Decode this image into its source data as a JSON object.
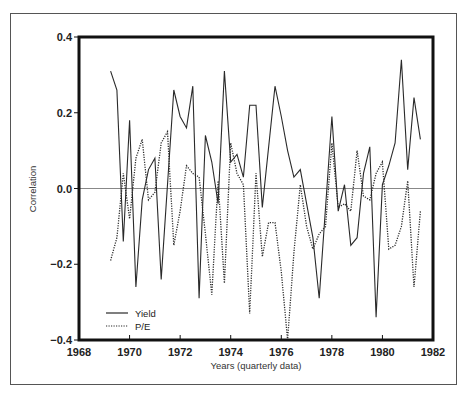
{
  "chart_data": {
    "type": "line",
    "title": "",
    "xlabel": "Years (quarterly data)",
    "ylabel": "Correlation",
    "xlim": [
      1968,
      1982
    ],
    "ylim": [
      -0.4,
      0.4
    ],
    "x_ticks": [
      1968,
      1970,
      1972,
      1974,
      1976,
      1978,
      1980,
      1982
    ],
    "x_tick_labels": [
      "1968",
      "1970",
      "1972",
      "1974",
      "1976",
      "1978",
      "1980",
      "1982"
    ],
    "y_ticks": [
      0.4,
      0.2,
      0.0,
      -0.2,
      -0.4
    ],
    "y_tick_labels": [
      "0.4",
      "0.2",
      "0.0",
      "−0.2",
      "−0.4"
    ],
    "grid": false,
    "reference_line": 0.0,
    "legend": {
      "position": "lower-left",
      "entries": [
        "Yield",
        "P/E"
      ]
    },
    "series": [
      {
        "name": "Yield",
        "style": "solid",
        "points": [
          [
            1969.25,
            0.31
          ],
          [
            1969.5,
            0.26
          ],
          [
            1969.75,
            -0.14
          ],
          [
            1970.0,
            0.18
          ],
          [
            1970.25,
            -0.26
          ],
          [
            1970.5,
            -0.03
          ],
          [
            1970.75,
            0.05
          ],
          [
            1971.0,
            0.08
          ],
          [
            1971.25,
            -0.24
          ],
          [
            1971.75,
            0.26
          ],
          [
            1972.0,
            0.19
          ],
          [
            1972.25,
            0.16
          ],
          [
            1972.5,
            0.27
          ],
          [
            1972.75,
            -0.29
          ],
          [
            1973.0,
            0.14
          ],
          [
            1973.25,
            0.07
          ],
          [
            1973.5,
            -0.04
          ],
          [
            1973.75,
            0.31
          ],
          [
            1974.0,
            0.07
          ],
          [
            1974.25,
            0.09
          ],
          [
            1974.5,
            0.03
          ],
          [
            1974.75,
            0.22
          ],
          [
            1975.0,
            0.22
          ],
          [
            1975.25,
            -0.05
          ],
          [
            1975.75,
            0.27
          ],
          [
            1976.0,
            0.19
          ],
          [
            1976.25,
            0.1
          ],
          [
            1976.5,
            0.03
          ],
          [
            1976.75,
            0.05
          ],
          [
            1977.0,
            -0.04
          ],
          [
            1977.25,
            -0.13
          ],
          [
            1977.5,
            -0.29
          ],
          [
            1978.0,
            0.19
          ],
          [
            1978.25,
            -0.06
          ],
          [
            1978.5,
            0.01
          ],
          [
            1978.75,
            -0.15
          ],
          [
            1979.0,
            -0.13
          ],
          [
            1979.25,
            0.04
          ],
          [
            1979.5,
            0.11
          ],
          [
            1979.75,
            -0.34
          ],
          [
            1980.0,
            0.01
          ],
          [
            1980.25,
            0.06
          ],
          [
            1980.5,
            0.12
          ],
          [
            1980.75,
            0.34
          ],
          [
            1981.0,
            0.05
          ],
          [
            1981.25,
            0.24
          ],
          [
            1981.5,
            0.13
          ]
        ]
      },
      {
        "name": "P/E",
        "style": "dotted",
        "points": [
          [
            1969.25,
            -0.19
          ],
          [
            1969.5,
            -0.13
          ],
          [
            1969.75,
            0.04
          ],
          [
            1970.0,
            -0.08
          ],
          [
            1970.25,
            0.08
          ],
          [
            1970.5,
            0.13
          ],
          [
            1970.75,
            -0.03
          ],
          [
            1971.0,
            -0.01
          ],
          [
            1971.25,
            0.12
          ],
          [
            1971.5,
            0.15
          ],
          [
            1971.75,
            -0.15
          ],
          [
            1972.0,
            -0.06
          ],
          [
            1972.25,
            0.06
          ],
          [
            1972.5,
            0.04
          ],
          [
            1972.75,
            0.03
          ],
          [
            1973.0,
            -0.12
          ],
          [
            1973.25,
            -0.28
          ],
          [
            1973.5,
            0.02
          ],
          [
            1973.75,
            -0.25
          ],
          [
            1974.0,
            0.12
          ],
          [
            1974.25,
            0.04
          ],
          [
            1974.5,
            0.01
          ],
          [
            1974.75,
            -0.33
          ],
          [
            1975.0,
            0.04
          ],
          [
            1975.25,
            -0.18
          ],
          [
            1975.5,
            -0.09
          ],
          [
            1975.75,
            -0.09
          ],
          [
            1976.0,
            -0.22
          ],
          [
            1976.25,
            -0.4
          ],
          [
            1976.5,
            -0.17
          ],
          [
            1976.75,
            0.01
          ],
          [
            1977.0,
            -0.1
          ],
          [
            1977.25,
            -0.16
          ],
          [
            1977.5,
            -0.12
          ],
          [
            1977.75,
            -0.1
          ],
          [
            1978.0,
            0.12
          ],
          [
            1978.25,
            -0.05
          ],
          [
            1978.5,
            -0.04
          ],
          [
            1978.75,
            -0.06
          ],
          [
            1979.0,
            0.1
          ],
          [
            1979.25,
            -0.02
          ],
          [
            1979.5,
            -0.03
          ],
          [
            1979.75,
            0.04
          ],
          [
            1980.0,
            0.07
          ],
          [
            1980.25,
            -0.16
          ],
          [
            1980.5,
            -0.15
          ],
          [
            1980.75,
            -0.1
          ],
          [
            1981.0,
            0.02
          ],
          [
            1981.25,
            -0.26
          ],
          [
            1981.5,
            -0.06
          ]
        ]
      }
    ]
  },
  "layout": {
    "plot_px": {
      "left": 79,
      "right": 433,
      "top": 37,
      "bottom": 340
    },
    "colors": {
      "axis": "#111111",
      "line": "#2a2a2a",
      "zero_line": "#888888",
      "frame": "#555555"
    }
  }
}
